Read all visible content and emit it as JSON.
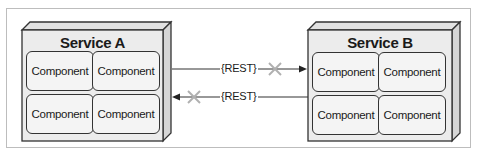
{
  "services": [
    {
      "title": "Service A",
      "components": [
        "Component",
        "Component",
        "Component",
        "Component"
      ]
    },
    {
      "title": "Service B",
      "components": [
        "Component",
        "Component",
        "Component",
        "Component"
      ]
    }
  ],
  "connections": [
    {
      "label": "{REST}",
      "from": "Service A",
      "to": "Service B",
      "blocked": true
    },
    {
      "label": "{REST}",
      "from": "Service B",
      "to": "Service A",
      "blocked": true
    }
  ],
  "colors": {
    "box_fill": "#ececec",
    "stroke": "#333333",
    "cross": "#b0b0b0",
    "frame": "#bdbdbd"
  }
}
